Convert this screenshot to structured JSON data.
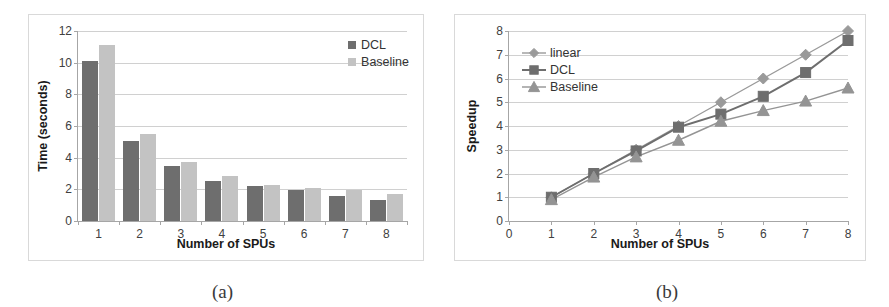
{
  "figure": {
    "subcaption_a": "(a)",
    "subcaption_b": "(b)"
  },
  "chart_data": [
    {
      "id": "chart-a",
      "type": "bar",
      "title": "",
      "xlabel": "Number of SPUs",
      "ylabel": "Time (seconds)",
      "categories": [
        "1",
        "2",
        "3",
        "4",
        "5",
        "6",
        "7",
        "8"
      ],
      "ylim": [
        0,
        12
      ],
      "yticks": [
        0,
        2,
        4,
        6,
        8,
        10,
        12
      ],
      "grid": true,
      "legend_position": "top-right",
      "series": [
        {
          "name": "DCL",
          "color": "#6e6e6e",
          "values": [
            10.1,
            5.05,
            3.5,
            2.55,
            2.2,
            1.95,
            1.6,
            1.3
          ]
        },
        {
          "name": "Baseline",
          "color": "#c3c3c3",
          "values": [
            11.1,
            5.5,
            3.75,
            2.85,
            2.3,
            2.1,
            1.95,
            1.7
          ]
        }
      ]
    },
    {
      "id": "chart-b",
      "type": "line",
      "title": "",
      "xlabel": "Number of SPUs",
      "ylabel": "Speedup",
      "x": [
        1,
        2,
        3,
        4,
        5,
        6,
        7,
        8
      ],
      "xlim": [
        0,
        8
      ],
      "xticks": [
        0,
        1,
        2,
        3,
        4,
        5,
        6,
        7,
        8
      ],
      "ylim": [
        0,
        8
      ],
      "yticks": [
        0,
        1,
        2,
        3,
        4,
        5,
        6,
        7,
        8
      ],
      "grid": true,
      "legend_position": "top-left",
      "series": [
        {
          "name": "linear",
          "color": "#9a9a9a",
          "marker": "diamond",
          "values": [
            1.0,
            2.0,
            3.0,
            4.0,
            5.0,
            6.0,
            7.0,
            8.0
          ]
        },
        {
          "name": "DCL",
          "color": "#6e6e6e",
          "marker": "square",
          "values": [
            1.0,
            2.0,
            2.95,
            3.95,
            4.5,
            5.25,
            6.25,
            7.6
          ]
        },
        {
          "name": "Baseline",
          "color": "#949494",
          "marker": "triangle",
          "values": [
            0.9,
            1.85,
            2.7,
            3.4,
            4.2,
            4.65,
            5.05,
            5.6
          ]
        }
      ]
    }
  ]
}
